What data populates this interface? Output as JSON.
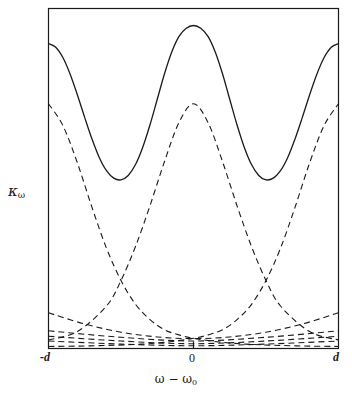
{
  "figure": {
    "axes": {
      "y_label": "κ",
      "y_label_sub": "ω",
      "x_label": "ω − ω",
      "x_label_sub": "0",
      "x_ticks": [
        "-d",
        "0",
        "d"
      ]
    },
    "colors": {
      "ink": "#1a1a1a",
      "background": "#ffffff"
    }
  },
  "chart_data": {
    "type": "line",
    "title": "",
    "xlabel": "ω − ω₀",
    "ylabel": "κ_ω",
    "xlim": [
      -1,
      1
    ],
    "ylim": [
      0,
      1
    ],
    "grid": false,
    "legend": "none",
    "xtick_values": [
      -1,
      0,
      1
    ],
    "xtick_labels": [
      "-d",
      "0",
      "d"
    ],
    "ytick_labels": [],
    "annotations": [
      "Solid curve is the sum (envelope) of the dashed component lines",
      "Dashed components are peaked at ω-ω₀ = -d, 0, and +d",
      "Additional shallow dashed baseline components lie near κ_ω = 0"
    ],
    "series": [
      {
        "name": "total (solid envelope)",
        "style": "solid",
        "x": [
          -1.0,
          -0.95,
          -0.9,
          -0.85,
          -0.8,
          -0.75,
          -0.7,
          -0.65,
          -0.6,
          -0.55,
          -0.5,
          -0.45,
          -0.4,
          -0.35,
          -0.3,
          -0.25,
          -0.2,
          -0.15,
          -0.1,
          -0.05,
          0.0,
          0.05,
          0.1,
          0.15,
          0.2,
          0.25,
          0.3,
          0.35,
          0.4,
          0.45,
          0.5,
          0.55,
          0.6,
          0.65,
          0.7,
          0.75,
          0.8,
          0.85,
          0.9,
          0.95,
          1.0
        ],
        "y": [
          0.897,
          0.886,
          0.855,
          0.806,
          0.745,
          0.679,
          0.616,
          0.562,
          0.523,
          0.501,
          0.496,
          0.509,
          0.541,
          0.592,
          0.658,
          0.733,
          0.808,
          0.872,
          0.918,
          0.942,
          0.95,
          0.942,
          0.918,
          0.872,
          0.808,
          0.733,
          0.658,
          0.592,
          0.541,
          0.509,
          0.496,
          0.501,
          0.523,
          0.562,
          0.616,
          0.679,
          0.745,
          0.806,
          0.855,
          0.886,
          0.897
        ]
      },
      {
        "name": "component at -d",
        "style": "dashed",
        "peak_x": -1.0,
        "peak_y": 0.72,
        "x": [
          -1.0,
          -0.9,
          -0.8,
          -0.7,
          -0.6,
          -0.5,
          -0.4,
          -0.3,
          -0.2,
          -0.1,
          0.0,
          0.2,
          0.4,
          0.6,
          0.8,
          1.0
        ],
        "y": [
          0.72,
          0.655,
          0.545,
          0.415,
          0.295,
          0.2,
          0.13,
          0.085,
          0.055,
          0.04,
          0.03,
          0.018,
          0.012,
          0.009,
          0.007,
          0.006
        ]
      },
      {
        "name": "component at 0",
        "style": "dashed",
        "peak_x": 0.0,
        "peak_y": 0.72,
        "x": [
          -1.0,
          -0.8,
          -0.6,
          -0.5,
          -0.4,
          -0.3,
          -0.2,
          -0.1,
          0.0,
          0.1,
          0.2,
          0.3,
          0.4,
          0.5,
          0.6,
          0.8,
          1.0
        ],
        "y": [
          0.025,
          0.05,
          0.125,
          0.2,
          0.3,
          0.42,
          0.55,
          0.665,
          0.72,
          0.665,
          0.55,
          0.42,
          0.3,
          0.2,
          0.125,
          0.05,
          0.025
        ]
      },
      {
        "name": "component at +d",
        "style": "dashed",
        "peak_x": 1.0,
        "peak_y": 0.72,
        "x": [
          -1.0,
          -0.8,
          -0.6,
          -0.4,
          -0.2,
          0.0,
          0.1,
          0.2,
          0.3,
          0.4,
          0.5,
          0.6,
          0.7,
          0.8,
          0.9,
          1.0
        ],
        "y": [
          0.006,
          0.007,
          0.009,
          0.012,
          0.018,
          0.03,
          0.04,
          0.055,
          0.085,
          0.13,
          0.2,
          0.295,
          0.415,
          0.545,
          0.655,
          0.72
        ]
      },
      {
        "name": "broad shallow component A",
        "style": "dashed",
        "x": [
          -1.0,
          -0.75,
          -0.5,
          -0.25,
          0.0,
          0.25,
          0.5,
          0.75,
          1.0
        ],
        "y": [
          0.105,
          0.072,
          0.048,
          0.034,
          0.029,
          0.034,
          0.048,
          0.072,
          0.105
        ]
      },
      {
        "name": "broad shallow component B",
        "style": "dashed",
        "x": [
          -1.0,
          -0.5,
          0.0,
          0.5,
          1.0
        ],
        "y": [
          0.052,
          0.033,
          0.022,
          0.033,
          0.052
        ]
      },
      {
        "name": "broad shallow component C",
        "style": "dashed",
        "x": [
          -1.0,
          -0.5,
          0.0,
          0.5,
          1.0
        ],
        "y": [
          0.036,
          0.022,
          0.014,
          0.022,
          0.036
        ]
      },
      {
        "name": "broad shallow component D",
        "style": "dashed",
        "x": [
          -1.0,
          -0.5,
          0.0,
          0.5,
          1.0
        ],
        "y": [
          0.022,
          0.013,
          0.008,
          0.013,
          0.022
        ]
      }
    ]
  }
}
